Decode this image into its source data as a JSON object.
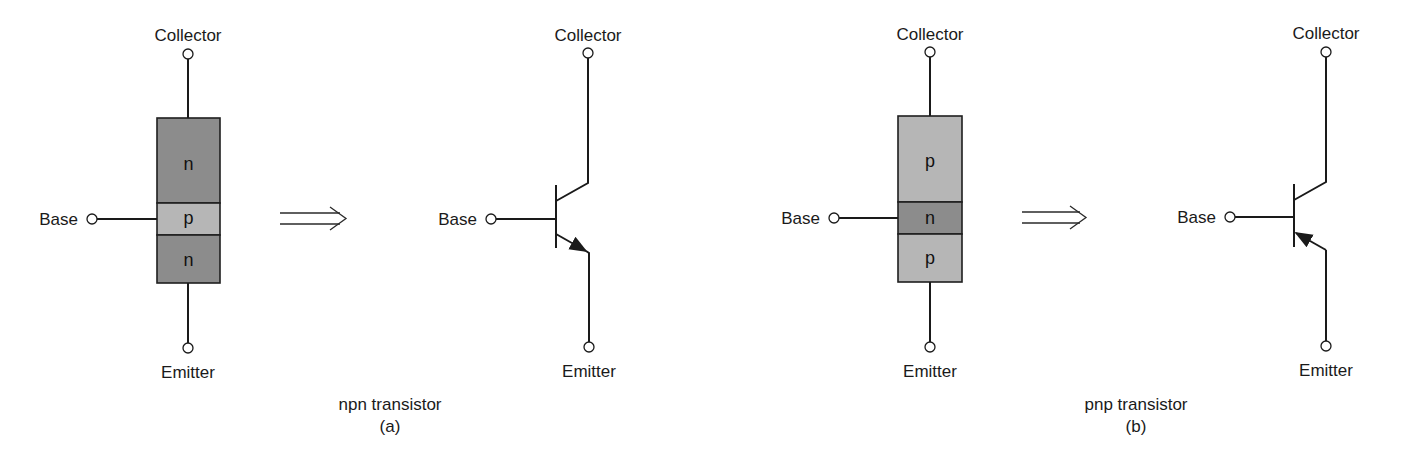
{
  "diagram": {
    "colors": {
      "n_region": "#8c8c8c",
      "p_region": "#b6b6b6",
      "line": "#1a1a1a",
      "background": "#ffffff"
    },
    "npn": {
      "caption": "npn transistor",
      "sublabel": "(a)",
      "block": {
        "collector_label": "Collector",
        "base_label": "Base",
        "emitter_label": "Emitter",
        "regions": [
          "n",
          "p",
          "n"
        ]
      },
      "symbol": {
        "collector_label": "Collector",
        "base_label": "Base",
        "emitter_label": "Emitter",
        "emitter_arrow": "outward"
      }
    },
    "pnp": {
      "caption": "pnp transistor",
      "sublabel": "(b)",
      "block": {
        "collector_label": "Collector",
        "base_label": "Base",
        "emitter_label": "Emitter",
        "regions": [
          "p",
          "n",
          "p"
        ]
      },
      "symbol": {
        "collector_label": "Collector",
        "base_label": "Base",
        "emitter_label": "Emitter",
        "emitter_arrow": "inward"
      }
    },
    "icons": {
      "equivalence_arrow": "double-arrow-right-icon",
      "terminal": "terminal-circle-icon"
    }
  }
}
